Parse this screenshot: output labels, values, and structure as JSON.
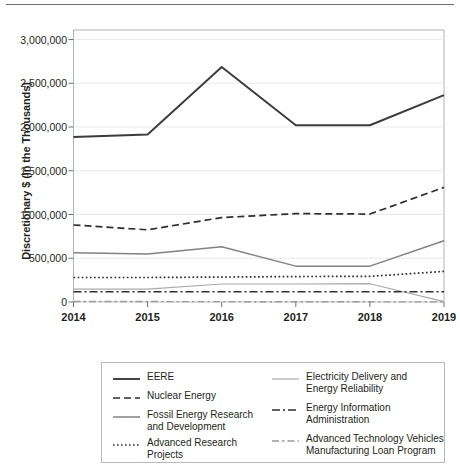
{
  "figure": {
    "top_rule": true,
    "background_color": "#ffffff"
  },
  "axes": {
    "ylabel": "Discretionary $ (in the Thousands)",
    "yticks": [
      "3,000,000",
      "2,500,000",
      "2,000,000",
      "1,500,000",
      "1,000,000",
      "500,000",
      "0"
    ],
    "xticks": [
      "2014",
      "2015",
      "2016",
      "2017",
      "2018",
      "2019"
    ]
  },
  "legend": {
    "items": [
      {
        "label": "EERE",
        "style": "solid",
        "color": "#3b3b3d",
        "width": 1.9,
        "dash": "none"
      },
      {
        "label": "Nuclear Energy",
        "style": "dashed",
        "color": "#2e2e30",
        "width": 1.7,
        "dash": "7,4"
      },
      {
        "label": "Fossil Energy Research\nand Development",
        "style": "solid",
        "color": "#818286",
        "width": 1.5,
        "dash": "none"
      },
      {
        "label": "Advanced Research\nProjects",
        "style": "dotted",
        "color": "#2e2e30",
        "width": 1.6,
        "dash": "1.6,2.4"
      },
      {
        "label": "Electricity Delivery and\nEnergy Reliability",
        "style": "solid",
        "color": "#a9aaad",
        "width": 1.2,
        "dash": "none"
      },
      {
        "label": "Energy Information\nAdministration",
        "style": "dash-dot",
        "color": "#2e2e30",
        "width": 1.7,
        "dash": "8,3,2,3"
      },
      {
        "label": "Advanced Technology Vehicles\nManufacturing Loan Program",
        "style": "dash-dot-light",
        "color": "#9a9b9e",
        "width": 1.4,
        "dash": "7,3,2.5,3"
      }
    ]
  },
  "chart_data": {
    "type": "line",
    "title": "",
    "xlabel": "",
    "ylabel": "Discretionary $ (in the Thousands)",
    "x": [
      2014,
      2015,
      2016,
      2017,
      2018,
      2019
    ],
    "categories": [
      "2014",
      "2015",
      "2016",
      "2017",
      "2018",
      "2019"
    ],
    "ylim": [
      -150000,
      3150000
    ],
    "yticks": [
      0,
      500000,
      1000000,
      1500000,
      2000000,
      2500000,
      3000000
    ],
    "grid": "horizontal",
    "legend_position": "bottom",
    "series": [
      {
        "name": "EERE",
        "values": [
          1885000,
          1915000,
          2685000,
          2020000,
          2020000,
          2365000
        ],
        "style": "solid",
        "color": "#3b3b3d"
      },
      {
        "name": "Nuclear Energy",
        "values": [
          880000,
          825000,
          965000,
          1010000,
          1005000,
          1310000
        ],
        "style": "dashed",
        "color": "#2e2e30"
      },
      {
        "name": "Fossil Energy Research and Development",
        "values": [
          562000,
          548000,
          632000,
          410000,
          410000,
          700000
        ],
        "style": "solid",
        "color": "#818286"
      },
      {
        "name": "Advanced Research Projects",
        "values": [
          280000,
          280000,
          285000,
          291000,
          293000,
          350000
        ],
        "style": "dotted",
        "color": "#2e2e30"
      },
      {
        "name": "Electricity Delivery and Energy Reliability",
        "values": [
          148000,
          147000,
          206000,
          206000,
          209000,
          5000
        ],
        "style": "solid",
        "color": "#a9aaad"
      },
      {
        "name": "Energy Information Administration",
        "values": [
          117000,
          117000,
          117000,
          117000,
          117000,
          117000
        ],
        "style": "dash-dot",
        "color": "#2e2e30"
      },
      {
        "name": "Advanced Technology Vehicles Manufacturing Loan Program",
        "values": [
          6000,
          5000,
          4000,
          3000,
          2000,
          1000
        ],
        "style": "dash-dot-light",
        "color": "#9a9b9e"
      }
    ]
  }
}
